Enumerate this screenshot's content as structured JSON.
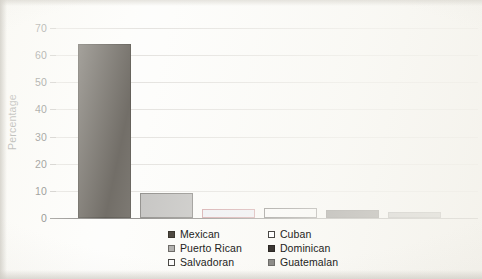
{
  "chart_data": {
    "type": "bar",
    "title": "",
    "xlabel": "",
    "ylabel": "Percentage",
    "ylim": [
      0,
      70
    ],
    "yticks": [
      0,
      10,
      20,
      30,
      40,
      50,
      60,
      70
    ],
    "ytick_labels": [
      "0",
      "10",
      "20",
      "30",
      "40",
      "50",
      "60",
      "70"
    ],
    "grid": "horizontal",
    "legend_position": "bottom-center",
    "legend_columns": 2,
    "categories": [
      "Mexican",
      "Puerto Rican",
      "Salvadoran",
      "Cuban",
      "Dominican",
      "Guatemalan"
    ],
    "values": [
      64.2,
      9.4,
      3.5,
      3.7,
      3.0,
      2.1
    ],
    "bars": [
      {
        "label": "Mexican",
        "value": 64.2,
        "fill": "#4f4a42",
        "stroke": "#3b372f"
      },
      {
        "label": "Puerto Rican",
        "value": 9.4,
        "fill": "#b3b2b0",
        "stroke": "#6e6c68"
      },
      {
        "label": "Salvadoran",
        "value": 3.5,
        "fill": "#eceef5",
        "stroke": "#c68a8e"
      },
      {
        "label": "Cuban",
        "value": 3.7,
        "fill": "#fefefe",
        "stroke": "#565350"
      },
      {
        "label": "Dominican",
        "value": 3.0,
        "fill": "#3b3733",
        "stroke": "#2c2824"
      },
      {
        "label": "Guatemalan",
        "value": 2.1,
        "fill": "#9a9996",
        "stroke": "#6d6c69"
      }
    ]
  },
  "legend": {
    "entries": [
      {
        "label": "Mexican",
        "swatch_fill": "#4f4a42",
        "swatch_stroke": "#3b372f"
      },
      {
        "label": "Cuban",
        "swatch_fill": "#ffffff",
        "swatch_stroke": "#4a4845"
      },
      {
        "label": "Puerto Rican",
        "swatch_fill": "#b3b2b0",
        "swatch_stroke": "#6e6c68"
      },
      {
        "label": "Dominican",
        "swatch_fill": "#3b3733",
        "swatch_stroke": "#2c2824"
      },
      {
        "label": "Salvadoran",
        "swatch_fill": "#fbfbfb",
        "swatch_stroke": "#4a4845"
      },
      {
        "label": "Guatemalan",
        "swatch_fill": "#8d8c89",
        "swatch_stroke": "#6d6c69"
      }
    ]
  },
  "colors": {
    "background": "#fdfdfb",
    "gridline": "#dedcd8",
    "axis": "#6f6d6a",
    "text": "#2f2f2d"
  }
}
